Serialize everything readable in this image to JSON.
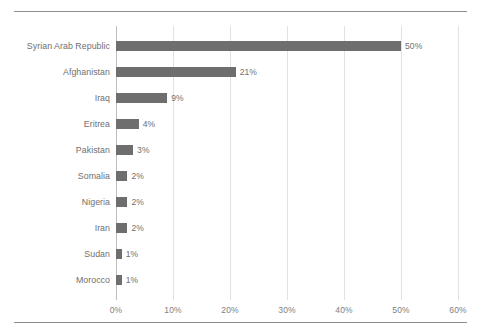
{
  "chart_data": {
    "type": "bar",
    "orientation": "horizontal",
    "title": "",
    "xlabel": "",
    "ylabel": "",
    "xlim": [
      0,
      60
    ],
    "xtick_labels": [
      "0%",
      "10%",
      "20%",
      "30%",
      "40%",
      "50%",
      "60%"
    ],
    "xtick_values": [
      0,
      10,
      20,
      30,
      40,
      50,
      60
    ],
    "grid": true,
    "legend": null,
    "categories": [
      "Syrian Arab Republic",
      "Afghanistan",
      "Iraq",
      "Eritrea",
      "Pakistan",
      "Somalia",
      "Nigeria",
      "Iran",
      "Sudan",
      "Morocco"
    ],
    "values": [
      50,
      21,
      9,
      4,
      3,
      2,
      2,
      2,
      1,
      1
    ],
    "value_labels": [
      "50%",
      "21%",
      "9%",
      "4%",
      "3%",
      "2%",
      "2%",
      "2%",
      "1%",
      "1%"
    ],
    "colors": {
      "bar": "#6e6e6e",
      "gridline": "#e2e2e2",
      "axis_line": "#bdbdbd",
      "text": "#6f6f6f",
      "rule": "#8d8d8d"
    }
  }
}
